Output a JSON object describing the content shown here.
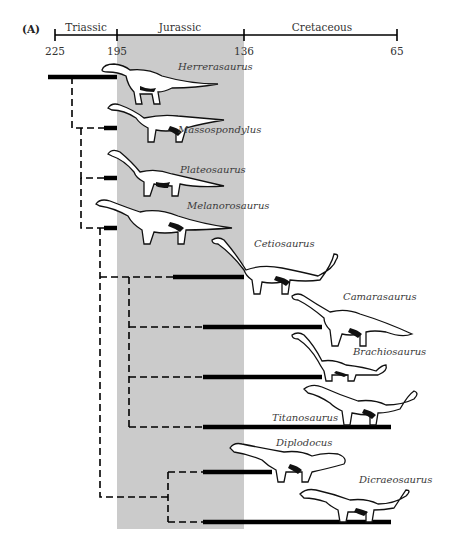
{
  "figure": {
    "panel_label": "(A)",
    "timescale": {
      "unit": "millions of years ago",
      "periods": [
        {
          "name": "Triassic",
          "start": 225,
          "end": 195
        },
        {
          "name": "Jurassic",
          "start": 195,
          "end": 136,
          "shaded": true
        },
        {
          "name": "Cretaceous",
          "start": 136,
          "end": 65
        }
      ],
      "ticks": [
        "225",
        "195",
        "136",
        "65"
      ]
    },
    "colors": {
      "shade": "#cbcbcb",
      "line": "#000000",
      "label": "#3a3a3a"
    },
    "taxa": [
      {
        "name": "Herrerasaurus",
        "range_start": 225,
        "range_end": 195
      },
      {
        "name": "Massospondylus",
        "range_start": 200,
        "range_end": 195
      },
      {
        "name": "Plateosaurus",
        "range_start": 200,
        "range_end": 195
      },
      {
        "name": "Melanorosaurus",
        "range_start": 200,
        "range_end": 195
      },
      {
        "name": "Cetiosaurus",
        "range_start": 165,
        "range_end": 136
      },
      {
        "name": "Camarasaurus",
        "range_start": 155,
        "range_end": 100
      },
      {
        "name": "Brachiosaurus",
        "range_start": 155,
        "range_end": 100
      },
      {
        "name": "Titanosaurus",
        "range_start": 155,
        "range_end": 65
      },
      {
        "name": "Diplodocus",
        "range_start": 155,
        "range_end": 120
      },
      {
        "name": "Dicraeosaurus",
        "range_start": 155,
        "range_end": 65
      }
    ]
  }
}
